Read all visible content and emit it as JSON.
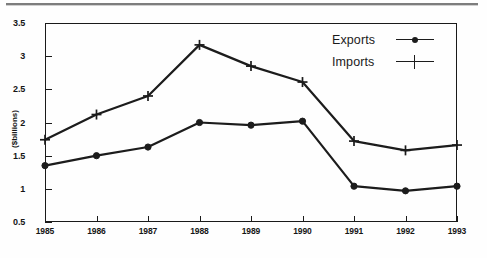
{
  "page": {
    "background_color": "#fefefe",
    "rule_color": "#7d7d7d"
  },
  "chart_data": {
    "type": "line",
    "title": "",
    "xlabel": "",
    "ylabel": "($billions)",
    "categories": [
      "1985",
      "1986",
      "1987",
      "1988",
      "1989",
      "1990",
      "1991",
      "1992",
      "1993"
    ],
    "x": [
      1985,
      1986,
      1987,
      1988,
      1989,
      1990,
      1991,
      1992,
      1993
    ],
    "series": [
      {
        "name": "Exports",
        "marker": "filled-circle",
        "color": "#1c1c1c",
        "values": [
          1.35,
          1.5,
          1.63,
          2.0,
          1.96,
          2.02,
          1.04,
          0.97,
          1.04
        ]
      },
      {
        "name": "Imports",
        "marker": "plus",
        "color": "#1c1c1c",
        "values": [
          1.74,
          2.12,
          2.4,
          3.17,
          2.85,
          2.61,
          1.72,
          1.58,
          1.66
        ]
      }
    ],
    "ylim": [
      0.5,
      3.5
    ],
    "yticks": [
      0.5,
      1,
      1.5,
      2,
      2.5,
      3,
      3.5
    ],
    "ytick_labels": [
      "0.5",
      "1",
      "1.5",
      "2",
      "2.5",
      "3",
      "3.5"
    ],
    "xlim": [
      1985,
      1993
    ],
    "grid": false,
    "legend_position": "top-right-inside",
    "legend_entries": [
      "Exports",
      "Imports"
    ]
  }
}
